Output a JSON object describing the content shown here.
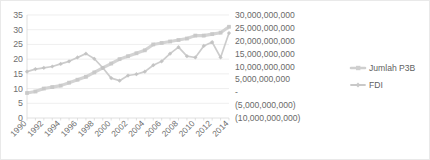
{
  "chart_data": {
    "type": "line",
    "title": "",
    "subtitle": "",
    "xlabel": "",
    "ylabel": "",
    "grid": true,
    "legend_position": "right",
    "x": [
      1990,
      1991,
      1992,
      1993,
      1994,
      1995,
      1996,
      1997,
      1998,
      1999,
      2000,
      2001,
      2002,
      2003,
      2004,
      2005,
      2006,
      2007,
      2008,
      2009,
      2010,
      2011,
      2012,
      2013,
      2014
    ],
    "xtick_labels": [
      "1990",
      "1992",
      "1994",
      "1996",
      "1998",
      "2000",
      "2002",
      "2004",
      "2006",
      "2008",
      "2010",
      "2012",
      "2014"
    ],
    "left_axis": {
      "label": "",
      "ylim": [
        0,
        35
      ],
      "ticks": [
        0,
        5,
        10,
        15,
        20,
        25,
        30,
        35
      ],
      "tick_labels": [
        "0",
        "5",
        "10",
        "15",
        "20",
        "25",
        "30",
        "35"
      ]
    },
    "right_axis": {
      "label": "",
      "ylim": [
        -10000000000,
        30000000000
      ],
      "ticks": [
        -10000000000,
        -5000000000,
        0,
        5000000000,
        10000000000,
        15000000000,
        20000000000,
        25000000000,
        30000000000
      ],
      "tick_labels": [
        "(10,000,000,000)",
        "(5,000,000,000)",
        "-",
        "5,000,000,000",
        "10,000,000,000",
        "15,000,000,000",
        "20,000,000,000",
        "25,000,000,000",
        "30,000,000,000"
      ]
    },
    "series": [
      {
        "name": "Jumlah P3B",
        "axis": "left",
        "color": "#cfcfcf",
        "marker": "square",
        "values": [
          8.5,
          9,
          10,
          10.5,
          11,
          12,
          13,
          14,
          15.5,
          17,
          18.5,
          20,
          21,
          22,
          23,
          25,
          25.5,
          26,
          26.5,
          27,
          28,
          28,
          28.5,
          29,
          31
        ]
      },
      {
        "name": "FDI",
        "axis": "right",
        "color": "#c9c9c9",
        "marker": "diamond",
        "values": [
          8,
          9,
          9.5,
          10,
          11,
          12,
          13.5,
          15,
          13,
          9.5,
          5.5,
          4.5,
          6.5,
          7,
          8,
          10.5,
          12,
          15,
          17.5,
          14,
          13.5,
          18,
          19.5,
          13.5,
          23
        ]
      }
    ],
    "legend": [
      {
        "label": "Jumlah P3B",
        "color": "#cfcfcf"
      },
      {
        "label": "FDI",
        "color": "#c9c9c9"
      }
    ]
  }
}
